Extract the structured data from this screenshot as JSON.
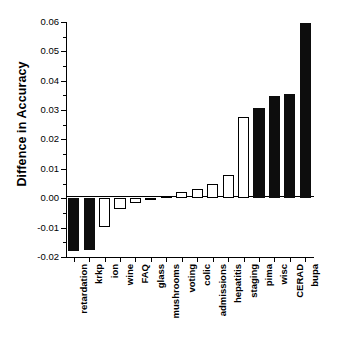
{
  "chart_data": {
    "type": "bar",
    "title": "",
    "subtitle": "",
    "xlabel": "",
    "ylabel": "Diffence in Accuracy",
    "ylim": [
      -0.02,
      0.06
    ],
    "ytick_labels": [
      "0.06",
      "0.05",
      "0.04",
      "0.03",
      "0.02",
      "0.01",
      "0.00",
      "-0.01",
      "-0.02"
    ],
    "ytick_values": [
      0.06,
      0.05,
      0.04,
      0.03,
      0.02,
      0.01,
      0.0,
      -0.01,
      -0.02
    ],
    "minor_ticks": true,
    "grid": false,
    "legend": "none",
    "categories": [
      "retardation",
      "krkp",
      "ion",
      "wine",
      "FAQ",
      "glass",
      "mushrooms",
      "voting",
      "colic",
      "admissions",
      "hepatitis",
      "staging",
      "pima",
      "wisc",
      "CERAD",
      "bupa"
    ],
    "values": [
      -0.0178,
      -0.0177,
      -0.0099,
      -0.0035,
      -0.0015,
      0.0,
      0.0008,
      0.002,
      0.0031,
      0.0049,
      0.0079,
      0.0278,
      0.0307,
      0.0348,
      0.0356,
      0.0595
    ],
    "bar_styles": [
      "filled",
      "filled",
      "open",
      "open",
      "open",
      "open",
      "open",
      "open",
      "open",
      "open",
      "open",
      "open",
      "filled",
      "filled",
      "filled",
      "filled"
    ],
    "colors": {
      "filled": "#0d0d0d",
      "open": "#ffffff",
      "edge": "#000000",
      "background": "#ffffff"
    }
  }
}
